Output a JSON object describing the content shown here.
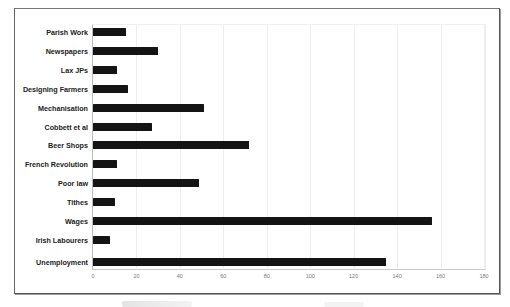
{
  "chart_data": {
    "type": "bar",
    "orientation": "horizontal",
    "title": "",
    "xlabel": "",
    "ylabel": "",
    "categories": [
      "Parish Work",
      "Newspapers",
      "Lax JPs",
      "Designing Farmers",
      "Mechanisation",
      "Cobbett et al",
      "Beer Shops",
      "French Revolution",
      "Poor law",
      "Tithes",
      "Wages",
      "Irish Labourers",
      "Unemployment"
    ],
    "values": [
      15,
      30,
      11,
      16,
      51,
      27,
      72,
      11,
      49,
      10,
      156,
      8,
      135
    ],
    "xlim": [
      0,
      180
    ],
    "x_ticks": [
      "0",
      "20",
      "40",
      "60",
      "80",
      "100",
      "120",
      "140",
      "160",
      "180"
    ],
    "grid": "faint vertical",
    "legend": "none",
    "bar_color": "#141414"
  }
}
